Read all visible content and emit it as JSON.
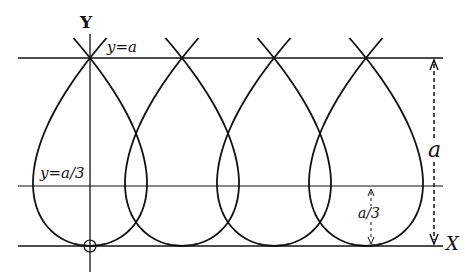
{
  "diagram": {
    "title": "",
    "axes": {
      "x_label": "X",
      "y_label": "Y"
    },
    "lines": {
      "top": "y=a",
      "middle": "y=a/3"
    },
    "dimensions": {
      "full_height": "a",
      "lower_height": "a/3"
    },
    "origin_marker": "circle",
    "loops_count": 4,
    "colors": {
      "ink": "#111111",
      "background": "#ffffff"
    }
  }
}
